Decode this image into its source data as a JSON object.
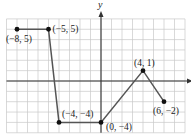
{
  "chart_data": {
    "type": "line",
    "title": "",
    "xlabel": "x",
    "ylabel": "y",
    "xlim": [
      -9,
      8
    ],
    "ylim": [
      -5,
      6
    ],
    "grid": true,
    "legend": null,
    "series": [
      {
        "name": "piecewise-linear graph",
        "points": [
          {
            "x": -8,
            "y": 5,
            "label": "(−8, 5)"
          },
          {
            "x": -5,
            "y": 5,
            "label": "(−5, 5)"
          },
          {
            "x": -4,
            "y": -4,
            "label": "(−4, −4)"
          },
          {
            "x": 0,
            "y": -4,
            "label": "(0, −4)"
          },
          {
            "x": 4,
            "y": 1,
            "label": "(4, 1)"
          },
          {
            "x": 6,
            "y": -2,
            "label": "(6, −2)"
          }
        ]
      }
    ]
  },
  "colors": {
    "grid": "#c8c8c8",
    "axis": "#333333",
    "line": "#555555",
    "point": "#111111"
  },
  "layout": {
    "origin_px": [
      101,
      81
    ],
    "unit_px_x": 10.5,
    "unit_px_y": 10.35
  }
}
